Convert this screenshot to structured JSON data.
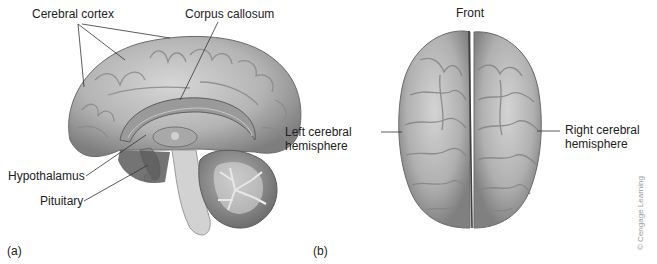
{
  "figure": {
    "panel_a": {
      "tag": "(a)",
      "view": "Midsagittal section of brain",
      "labels": {
        "cerebral_cortex": "Cerebral cortex",
        "corpus_callosum": "Corpus callosum",
        "hypothalamus": "Hypothalamus",
        "pituitary": "Pituitary"
      }
    },
    "panel_b": {
      "tag": "(b)",
      "view": "Superior view of brain",
      "orientation_label": "Front",
      "labels": {
        "left_hemisphere_line1": "Left cerebral",
        "left_hemisphere_line2": "hemisphere",
        "right_hemisphere_line1": "Right cerebral",
        "right_hemisphere_line2": "hemisphere"
      }
    },
    "credit": "© Cengage Learning"
  },
  "colors": {
    "background": "#ffffff",
    "brain_light": "#c9c9c9",
    "brain_mid": "#9d9d9d",
    "brain_dark": "#5c5c5c",
    "label_text": "#222222",
    "credit_text": "#9a9a9a"
  }
}
